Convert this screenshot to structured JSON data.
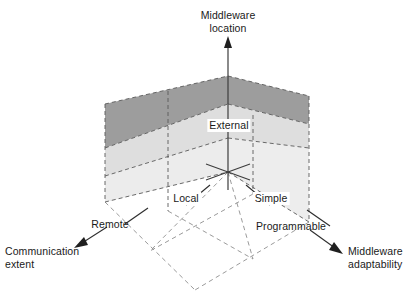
{
  "figure": {
    "type": "3d-design-space-cube",
    "title_visible": false
  },
  "axes": {
    "vertical": {
      "name": "middleware-location",
      "label_line1": "Middleware",
      "label_line2": "location",
      "arrow_direction": "up",
      "tick_labels": [
        "External"
      ]
    },
    "left": {
      "name": "communication-extent",
      "label_line1": "Communication",
      "label_line2": "extent",
      "arrow_direction": "down-left",
      "tick_labels": [
        "Remote"
      ]
    },
    "right": {
      "name": "middleware-adaptability",
      "label_line1": "Middleware",
      "label_line2": "adaptability",
      "arrow_direction": "down-right",
      "tick_labels": [
        "Programmable"
      ]
    }
  },
  "origin_labels": {
    "left_axis_origin": "Local",
    "right_axis_origin": "Simple"
  },
  "labels": {
    "middleware_location": "Middleware location",
    "external": "External",
    "local": "Local",
    "simple": "Simple",
    "remote": "Remote",
    "programmable": "Programmable",
    "communication_extent": "Communication extent",
    "middleware_adaptability": "Middleware adaptability"
  },
  "colors": {
    "band_dark": "#9d9d9d",
    "band_light": "#e4e4e4",
    "band_lighter": "#efefef",
    "line": "#4d4d4d",
    "dashed": "#5a5a5a",
    "text": "#1a1a1a",
    "background": "#ffffff"
  },
  "geometry": {
    "apex": [
      228,
      76
    ],
    "origin": [
      228,
      172
    ],
    "left_top": [
      105,
      104
    ],
    "right_top": [
      309,
      96
    ],
    "left_bottom": [
      105,
      202
    ],
    "right_bottom": [
      309,
      222
    ]
  }
}
